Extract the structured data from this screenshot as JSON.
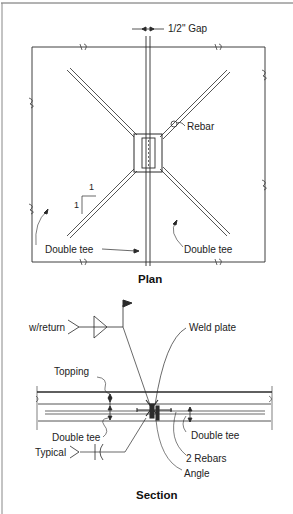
{
  "plan": {
    "title": "Plan",
    "labels": {
      "gap": "1/2\" Gap",
      "rebar": "Rebar",
      "slope_rise": "1",
      "slope_run": "1",
      "double_tee_left": "Double tee",
      "double_tee_right": "Double tee"
    }
  },
  "section": {
    "title": "Section",
    "labels": {
      "w_return": "w/return",
      "weld_plate": "Weld plate",
      "topping": "Topping",
      "double_tee_left": "Double tee",
      "double_tee_right": "Double tee",
      "typical": "Typical",
      "rebars": "2 Rebars",
      "angle": "Angle"
    }
  },
  "colors": {
    "line": "#2a2a2a",
    "frame": "#555555",
    "background": "#ffffff"
  }
}
